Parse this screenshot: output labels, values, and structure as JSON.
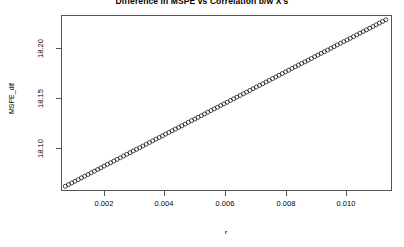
{
  "chart_data": {
    "type": "scatter",
    "title": "Difference in MSPE vs Correlation b/w X's",
    "xlabel": "r",
    "ylabel": "MSPE_dif",
    "xlim": [
      0.001,
      0.01122
    ],
    "ylim": [
      18.0715,
      18.2405
    ],
    "xticks": [
      0.002,
      0.004,
      0.006,
      0.008,
      0.01
    ],
    "xtick_labels": [
      "0.002",
      "0.004",
      "0.006",
      "0.008",
      "0.010"
    ],
    "yticks": [
      18.1,
      18.15,
      18.2
    ],
    "ytick_labels": [
      "18.10",
      "18.15",
      "18.20"
    ],
    "grid": false,
    "legend": false,
    "marker": "open-circle",
    "marker_color": "#000000",
    "marker_size_px": 4,
    "x": [
      0.0011,
      0.0012,
      0.0013,
      0.0014,
      0.0015,
      0.0016,
      0.0017,
      0.0018,
      0.0019,
      0.002,
      0.0021,
      0.0022,
      0.0023,
      0.0024,
      0.0025,
      0.0026,
      0.0027,
      0.0028,
      0.0029,
      0.003,
      0.0031,
      0.0032,
      0.0033,
      0.0034,
      0.0035,
      0.0036,
      0.0037,
      0.0038,
      0.0039,
      0.004,
      0.0041,
      0.0042,
      0.0043,
      0.0044,
      0.0045,
      0.0046,
      0.0047,
      0.0048,
      0.0049,
      0.005,
      0.0051,
      0.0052,
      0.0053,
      0.0054,
      0.0055,
      0.0056,
      0.0057,
      0.0058,
      0.0059,
      0.006,
      0.0061,
      0.0062,
      0.0063,
      0.0064,
      0.0065,
      0.0066,
      0.0067,
      0.0068,
      0.0069,
      0.007,
      0.0071,
      0.0072,
      0.0073,
      0.0074,
      0.0075,
      0.0076,
      0.0077,
      0.0078,
      0.0079,
      0.008,
      0.0081,
      0.0082,
      0.0083,
      0.0084,
      0.0085,
      0.0086,
      0.0087,
      0.0088,
      0.0089,
      0.009,
      0.0091,
      0.0092,
      0.0093,
      0.0094,
      0.0095,
      0.0096,
      0.0097,
      0.0098,
      0.0099,
      0.01,
      0.0101,
      0.0102,
      0.0103,
      0.0104,
      0.0105,
      0.0106,
      0.0107,
      0.0108,
      0.0109,
      0.011
    ],
    "y": [
      18.077,
      18.0786,
      18.0802,
      18.0818,
      18.0834,
      18.0851,
      18.0867,
      18.0883,
      18.0899,
      18.0915,
      18.0931,
      18.0947,
      18.0964,
      18.098,
      18.0996,
      18.1012,
      18.1028,
      18.1044,
      18.1061,
      18.1077,
      18.1093,
      18.1109,
      18.1125,
      18.1141,
      18.1157,
      18.1174,
      18.119,
      18.1206,
      18.1222,
      18.1238,
      18.1254,
      18.1271,
      18.1287,
      18.1303,
      18.1319,
      18.1335,
      18.1351,
      18.1367,
      18.1384,
      18.14,
      18.1416,
      18.1432,
      18.1448,
      18.1464,
      18.1481,
      18.1497,
      18.1513,
      18.1529,
      18.1545,
      18.1561,
      18.1577,
      18.1594,
      18.161,
      18.1626,
      18.1642,
      18.1658,
      18.1674,
      18.1691,
      18.1707,
      18.1723,
      18.1739,
      18.1755,
      18.1771,
      18.1787,
      18.1804,
      18.182,
      18.1836,
      18.1852,
      18.1868,
      18.1884,
      18.1901,
      18.1917,
      18.1933,
      18.1949,
      18.1965,
      18.1981,
      18.1997,
      18.2014,
      18.203,
      18.2046,
      18.2062,
      18.2078,
      18.2094,
      18.2111,
      18.2127,
      18.2143,
      18.2159,
      18.2175,
      18.2191,
      18.2207,
      18.2224,
      18.224,
      18.2256,
      18.2272,
      18.2288,
      18.2304,
      18.2321,
      18.2337,
      18.2353,
      18.2369
    ]
  },
  "axes": {
    "y_title": "MSPE_dif",
    "x_title": "r",
    "y_labels": [
      "18.20",
      "18.15",
      "18.10"
    ],
    "x_labels": [
      "0.002",
      "0.004",
      "0.006",
      "0.008",
      "0.010"
    ]
  }
}
